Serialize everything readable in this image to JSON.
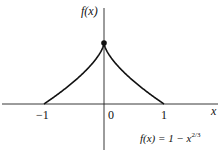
{
  "chart_data": {
    "type": "line",
    "title": "",
    "function": "f(x) = 1 - x^(2/3)",
    "xlabel": "x",
    "ylabel": "f(x)",
    "x_ticks": [
      "-1",
      "0",
      "1"
    ],
    "xlim": [
      -1.7,
      1.9
    ],
    "ylim": [
      -0.7,
      1.7
    ],
    "grid": false,
    "series": [
      {
        "name": "f(x) = 1 - x^(2/3)",
        "x": [
          -1,
          -0.9,
          -0.8,
          -0.7,
          -0.6,
          -0.5,
          -0.4,
          -0.3,
          -0.2,
          -0.1,
          0,
          0.1,
          0.2,
          0.3,
          0.4,
          0.5,
          0.6,
          0.7,
          0.8,
          0.9,
          1
        ],
        "y": [
          0,
          0.068,
          0.138,
          0.212,
          0.289,
          0.37,
          0.457,
          0.552,
          0.658,
          0.785,
          1,
          0.785,
          0.658,
          0.552,
          0.457,
          0.37,
          0.289,
          0.212,
          0.138,
          0.068,
          0
        ]
      }
    ],
    "annotations": [
      {
        "type": "point",
        "x": 0,
        "y": 1,
        "style": "filled-dot"
      }
    ]
  },
  "labels": {
    "y_axis": "f(x)",
    "x_axis": "x",
    "tick_neg1": "−1",
    "tick_0": "0",
    "tick_1": "1",
    "formula_base": "f(x) = 1 − x",
    "formula_exp": "2/3"
  }
}
